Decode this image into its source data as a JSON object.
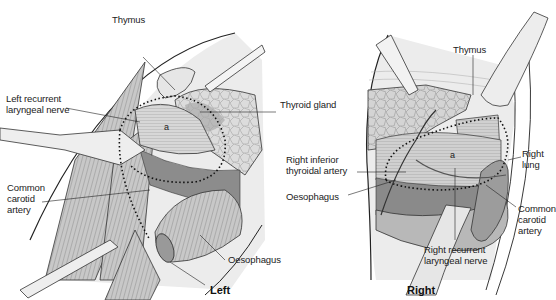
{
  "figure": {
    "panels": [
      {
        "id": "left",
        "side_label": "Left",
        "labels": {
          "thymus": "Thymus",
          "left_recurrent_laryngeal_nerve": "Left recurrent\nlaryngeal nerve",
          "thyroid_gland": "Thyroid gland",
          "common_carotid_artery": "Common\ncarotid\nartery",
          "oesophagus": "Oesophagus",
          "marker_a": "a"
        }
      },
      {
        "id": "right",
        "side_label": "Right",
        "labels": {
          "thymus": "Thymus",
          "right_inferior_thyroidal_artery": "Right inferior\nthyroidal artery",
          "oesophagus": "Oesophagus",
          "right_lung": "Right\nlung",
          "common_carotid_artery": "Common\ncarotid\nartery",
          "right_recurrent_laryngeal_nerve": "Right recurrent\nlaryngeal nerve",
          "marker_a": "a"
        }
      }
    ],
    "colors": {
      "line": "#222222",
      "tissue_light": "#e4e4e4",
      "tissue_mid": "#bdbdbd",
      "tissue_dark": "#8a8a8a",
      "background": "#ffffff"
    }
  }
}
